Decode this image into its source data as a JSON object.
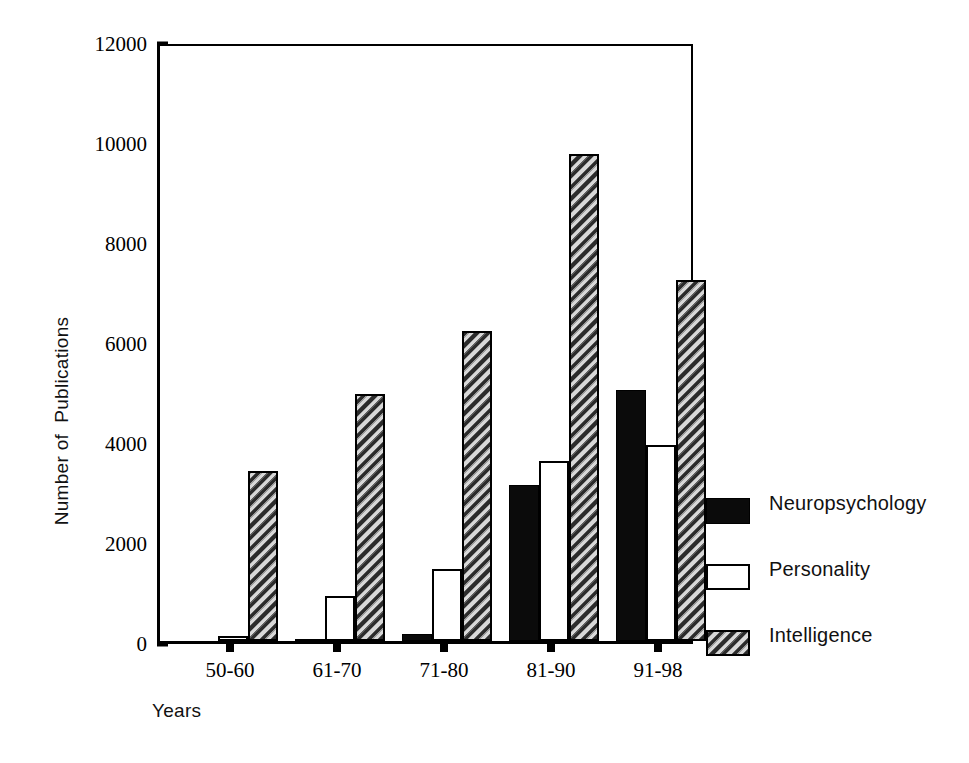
{
  "chart_data": {
    "type": "bar",
    "title": "",
    "xlabel": "Years",
    "ylabel": "Number of  Publications",
    "categories": [
      "50-60",
      "61-70",
      "71-80",
      "81-90",
      "91-98"
    ],
    "series": [
      {
        "name": "Neuropsychology",
        "swatch": "solid-black",
        "color": "#0b0b0b",
        "values": [
          0,
          40,
          150,
          3130,
          5030
        ]
      },
      {
        "name": "Personality",
        "swatch": "white-outline",
        "color": "#ffffff",
        "values": [
          110,
          900,
          1450,
          3600,
          3930
        ]
      },
      {
        "name": "Intelligence",
        "swatch": "diagonal-hatch",
        "color": "#8e8e8e",
        "values": [
          3400,
          4950,
          6200,
          9750,
          7230
        ]
      }
    ],
    "ylim": [
      0,
      12000
    ],
    "yticks": [
      0,
      2000,
      4000,
      6000,
      8000,
      10000,
      12000
    ],
    "ytick_labels": [
      "0",
      "2000",
      "4000",
      "6000",
      "8000",
      "10000",
      "12000"
    ],
    "grid": false,
    "legend_position": "right"
  },
  "legend": {
    "entries": [
      {
        "label": "Neuropsychology",
        "swatch": "solid-black"
      },
      {
        "label": "Personality",
        "swatch": "white-outline"
      },
      {
        "label": "Intelligence",
        "swatch": "diagonal-hatch"
      }
    ]
  }
}
